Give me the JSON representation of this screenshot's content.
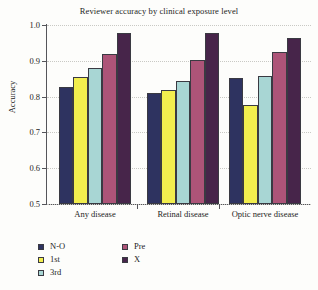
{
  "chart_data": {
    "type": "bar",
    "title": "Reviewer accuracy by clinical exposure level",
    "xlabel": "",
    "ylabel": "Accuracy",
    "categories": [
      "Any disease",
      "Retinal disease",
      "Optic nerve disease"
    ],
    "ylim": [
      0.5,
      1.0
    ],
    "yticks": [
      "0.5",
      "0.6",
      "0.7",
      "0.8",
      "0.9",
      "1.0"
    ],
    "ytick_values": [
      0.5,
      0.6,
      0.7,
      0.8,
      0.9,
      1.0
    ],
    "grid": true,
    "legend_position": "below-axes-left",
    "series": [
      {
        "name": "N-O",
        "color": "#2e3360",
        "values": [
          0.827,
          0.81,
          0.853
        ]
      },
      {
        "name": "1st",
        "color": "#f2ee4e",
        "values": [
          0.854,
          0.819,
          0.777
        ]
      },
      {
        "name": "3rd",
        "color": "#a8d6d4",
        "values": [
          0.879,
          0.844,
          0.858
        ]
      },
      {
        "name": "Pre",
        "color": "#ad5478",
        "values": [
          0.92,
          0.902,
          0.925
        ]
      },
      {
        "name": "X",
        "color": "#47254a",
        "values": [
          0.978,
          0.979,
          0.965
        ]
      }
    ]
  }
}
